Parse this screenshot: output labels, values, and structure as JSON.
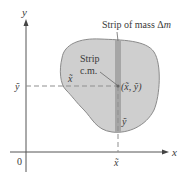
{
  "figure": {
    "axes": {
      "y_label": "y",
      "x_label": "x",
      "origin_label": "0"
    },
    "labels": {
      "strip_mass": "Strip of mass Δm",
      "strip_mass_prefix": "Strip of mass Δ",
      "strip_mass_var": "m",
      "strip_cm_line1": "Strip",
      "strip_cm_line2": "c.m.",
      "centroid_point": "(x̃, ỹ)",
      "x_tilde_inside": "x̃",
      "y_tilde_inside": "ỹ",
      "y_tilde_axis": "ỹ",
      "x_tilde_axis": "x̃"
    },
    "colors": {
      "region_fill": "#cfcfcf",
      "region_stroke": "#8a8a8a",
      "strip_fill": "#a6a6a6",
      "axis": "#555555",
      "dash": "#8f8f8f",
      "text": "#3a3a3a"
    }
  }
}
